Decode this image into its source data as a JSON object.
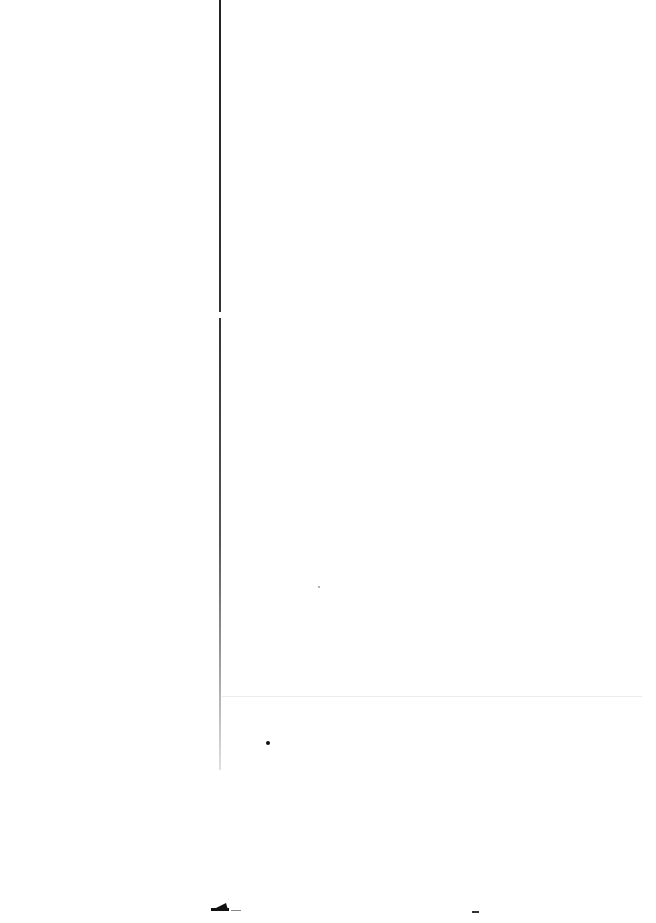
{
  "page": {
    "background": "#ffffff",
    "text_content": []
  },
  "elements": {
    "vertical_rule": {
      "x": 220,
      "color": "#222222"
    },
    "horizontal_rule": {
      "y": 696,
      "color": "#ececec"
    },
    "marks": [
      "speck",
      "speck",
      "shoe-shaped-mark",
      "dash",
      "dash"
    ]
  }
}
